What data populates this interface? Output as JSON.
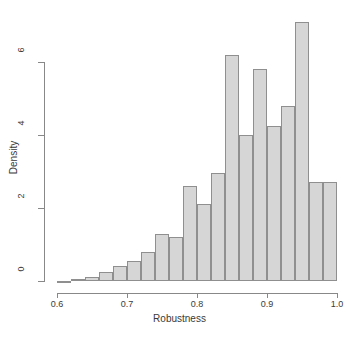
{
  "chart_data": {
    "type": "bar",
    "subtype": "histogram",
    "title": "",
    "xlabel": "Robustness",
    "ylabel": "Density",
    "xlim": [
      0.6,
      1.0
    ],
    "ylim": [
      0,
      7.1
    ],
    "grid": false,
    "legend": null,
    "bin_width": 0.02,
    "bar_fill_color": "#d6d6d6",
    "bar_border_color": "#8f8f8f",
    "axis_color": "#888888",
    "xticks": [
      0.6,
      0.7,
      0.8,
      0.9,
      1.0
    ],
    "xtick_labels": [
      "0.6",
      "0.7",
      "0.8",
      "0.9",
      "1.0"
    ],
    "yticks": [
      0,
      2,
      4,
      6
    ],
    "ytick_labels": [
      "0",
      "2",
      "4",
      "6"
    ],
    "bin_edges": [
      0.6,
      0.62,
      0.64,
      0.66,
      0.68,
      0.7,
      0.72,
      0.74,
      0.76,
      0.78,
      0.8,
      0.82,
      0.84,
      0.86,
      0.88,
      0.9,
      0.92,
      0.94,
      0.96,
      0.98,
      1.0
    ],
    "categories": [
      "0.60-0.62",
      "0.62-0.64",
      "0.64-0.66",
      "0.66-0.68",
      "0.68-0.70",
      "0.70-0.72",
      "0.72-0.74",
      "0.74-0.76",
      "0.76-0.78",
      "0.78-0.80",
      "0.80-0.82",
      "0.82-0.84",
      "0.84-0.86",
      "0.86-0.88",
      "0.88-0.90",
      "0.90-0.92",
      "0.92-0.94",
      "0.94-0.96",
      "0.96-0.98",
      "0.98-1.00"
    ],
    "values": [
      0.0,
      0.05,
      0.1,
      0.25,
      0.4,
      0.55,
      0.8,
      1.3,
      1.2,
      2.6,
      2.1,
      2.95,
      6.2,
      4.0,
      5.8,
      4.25,
      4.8,
      7.1,
      2.7,
      2.7
    ]
  }
}
